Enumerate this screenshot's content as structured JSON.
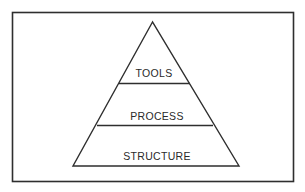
{
  "diagram": {
    "type": "pyramid",
    "layers_top_to_bottom": [
      {
        "label": "TOOLS"
      },
      {
        "label": "PROCESS"
      },
      {
        "label": "STRUCTURE"
      }
    ],
    "colors": {
      "stroke": "#2e2e2e",
      "background": "#ffffff",
      "text": "#2a2a2a"
    }
  }
}
